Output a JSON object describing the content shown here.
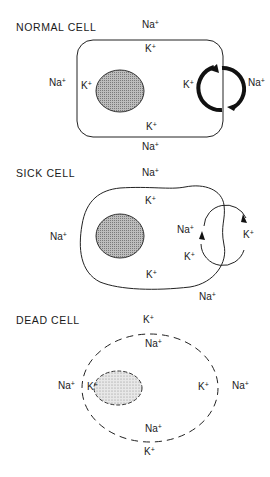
{
  "panels": [
    {
      "title": "NORMAL CELL",
      "membrane": "solid",
      "nucleus": "shaded",
      "pump": "strong",
      "ions": [
        {
          "ion": "Na",
          "charge": "+",
          "pos": "outside-top"
        },
        {
          "ion": "K",
          "charge": "+",
          "pos": "inside-top"
        },
        {
          "ion": "Na",
          "charge": "+",
          "pos": "outside-left"
        },
        {
          "ion": "K",
          "charge": "+",
          "pos": "inside-left"
        },
        {
          "ion": "K",
          "charge": "+",
          "pos": "inside-right"
        },
        {
          "ion": "Na",
          "charge": "+",
          "pos": "outside-right"
        },
        {
          "ion": "K",
          "charge": "+",
          "pos": "inside-bottom"
        },
        {
          "ion": "Na",
          "charge": "+",
          "pos": "outside-bottom"
        }
      ]
    },
    {
      "title": "SICK CELL",
      "membrane": "irregular",
      "nucleus": "shaded",
      "pump": "weak",
      "ions": [
        {
          "ion": "Na",
          "charge": "+",
          "pos": "outside-top"
        },
        {
          "ion": "K",
          "charge": "+",
          "pos": "inside-top"
        },
        {
          "ion": "Na",
          "charge": "+",
          "pos": "outside-left"
        },
        {
          "ion": "Na",
          "charge": "+",
          "pos": "inside-right"
        },
        {
          "ion": "K",
          "charge": "+",
          "pos": "outside-right"
        },
        {
          "ion": "K",
          "charge": "+",
          "pos": "inside-right-lower"
        },
        {
          "ion": "K",
          "charge": "+",
          "pos": "inside-bottom"
        },
        {
          "ion": "Na",
          "charge": "+",
          "pos": "outside-bottom"
        }
      ]
    },
    {
      "title": "DEAD CELL",
      "membrane": "dashed",
      "nucleus": "dashed-stippled",
      "pump": "none",
      "ions": [
        {
          "ion": "K",
          "charge": "+",
          "pos": "outside-top"
        },
        {
          "ion": "Na",
          "charge": "+",
          "pos": "inside-top"
        },
        {
          "ion": "Na",
          "charge": "+",
          "pos": "outside-left"
        },
        {
          "ion": "K",
          "charge": "+",
          "pos": "inside-left"
        },
        {
          "ion": "K",
          "charge": "+",
          "pos": "inside-right"
        },
        {
          "ion": "Na",
          "charge": "+",
          "pos": "outside-right"
        },
        {
          "ion": "Na",
          "charge": "+",
          "pos": "inside-bottom"
        },
        {
          "ion": "K",
          "charge": "+",
          "pos": "outside-bottom"
        }
      ]
    }
  ]
}
